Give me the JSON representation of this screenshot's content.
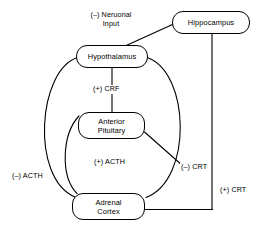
{
  "diagram": {
    "nodes": [
      {
        "id": "hippocampus",
        "label": "Hippocampus"
      },
      {
        "id": "hypothalamus",
        "label": "Hypothalamus"
      },
      {
        "id": "anterior-pituitary",
        "label": "Anterior\nPituitary",
        "line1": "Anterior",
        "line2": "Pituitary"
      },
      {
        "id": "adrenal-cortex",
        "label": "Adrenal\nCortex",
        "line1": "Adrenal",
        "line2": "Cortex"
      }
    ],
    "edge_labels": [
      {
        "id": "neuronal-input",
        "line1": "(–) Neruonal",
        "line2": "Input"
      },
      {
        "id": "crf",
        "text": "(+) CRF"
      },
      {
        "id": "acth-positive",
        "text": "(+) ACTH"
      },
      {
        "id": "acth-negative",
        "text": "(–) ACTH"
      },
      {
        "id": "crt-negative",
        "text": "(–) CRT"
      },
      {
        "id": "crt-positive",
        "text": "(+) CRT"
      }
    ],
    "colors": {
      "stroke": "#000000",
      "background": "#ffffff",
      "text": "#000000"
    }
  }
}
